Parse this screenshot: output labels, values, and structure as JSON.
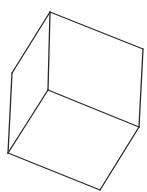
{
  "diagram": {
    "type": "wireframe-cube",
    "stroke_color": "#2a2a2a",
    "background": "#ffffff",
    "vertices": {
      "top": [
        50,
        12
      ],
      "right_top": [
        143,
        49
      ],
      "left_top": [
        12,
        73
      ],
      "back": [
        48,
        90
      ],
      "right_bottom": [
        139,
        127
      ],
      "left_bottom": [
        8,
        153
      ],
      "bottom": [
        100,
        190
      ]
    },
    "edges": [
      [
        "top",
        "right_top"
      ],
      [
        "top",
        "left_top"
      ],
      [
        "top",
        "back"
      ],
      [
        "right_top",
        "right_bottom"
      ],
      [
        "left_top",
        "left_bottom"
      ],
      [
        "back",
        "right_bottom"
      ],
      [
        "back",
        "left_bottom"
      ],
      [
        "right_bottom",
        "bottom"
      ],
      [
        "left_bottom",
        "bottom"
      ]
    ]
  }
}
